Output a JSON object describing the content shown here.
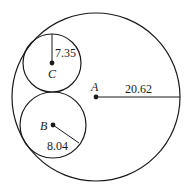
{
  "diagram": {
    "circles": [
      {
        "name": "A",
        "label": "A",
        "radius_label": "20.62"
      },
      {
        "name": "B",
        "label": "B",
        "radius_label": "8.04"
      },
      {
        "name": "C",
        "label": "C",
        "radius_label": "7.35"
      }
    ]
  }
}
